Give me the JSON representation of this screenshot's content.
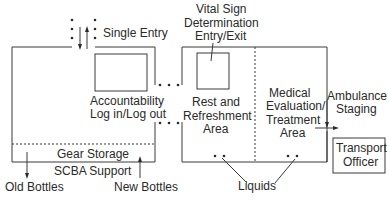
{
  "diagram": {
    "type": "rehab-area-floor-plan",
    "labels": {
      "single_entry": "Single Entry",
      "vital_sign_1": "Vital Sign",
      "vital_sign_2": "Determination",
      "vital_sign_3": "Entry/Exit",
      "accountability_1": "Accountability",
      "accountability_2": "Log in/Log out",
      "rest_1": "Rest and",
      "rest_2": "Refreshment",
      "rest_3": "Area",
      "medical_1": "Medical",
      "medical_2": "Evaluation/",
      "medical_3": "Treatment",
      "medical_4": "Area",
      "ambulance_1": "Ambulance",
      "ambulance_2": "Staging",
      "transport_1": "Transport",
      "transport_2": "Officer",
      "gear_storage": "Gear Storage",
      "scba_support": "SCBA Support",
      "old_bottles": "Old Bottles",
      "new_bottles": "New Bottles",
      "liquids": "Liquids"
    },
    "colors": {
      "line": "#3a3a3a",
      "background": "#ffffff"
    }
  }
}
